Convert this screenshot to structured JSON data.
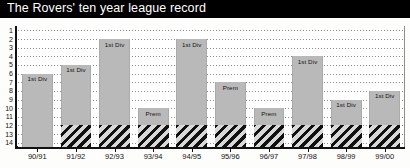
{
  "title": "The Rovers' ten year league record",
  "colors": {
    "title_bar": "#000000",
    "title_text": "#ffffff",
    "bar_fill": "#b9b9b9",
    "hatch_fill": "#d8d8d8",
    "hatch_line": "#111111",
    "gridline": "#8e8e8e",
    "axis": "#111111",
    "background": "#ffffff"
  },
  "axes": {
    "y_ticks": [
      "1",
      "2",
      "3",
      "4",
      "5",
      "6",
      "7",
      "8",
      "9",
      "10",
      "11",
      "12",
      "13",
      "14"
    ],
    "y_min": 1,
    "y_max": 14,
    "y_inverted": true,
    "x_ticks": [
      "90/91",
      "91/92",
      "92/93",
      "93/94",
      "94/95",
      "95/96",
      "96/97",
      "97/98",
      "98/99",
      "99/00"
    ]
  },
  "chart_data": {
    "type": "bar",
    "title": "The Rovers' ten year league record",
    "xlabel": "",
    "ylabel": "",
    "ylim": [
      1,
      14
    ],
    "y_inverted": true,
    "grid": true,
    "legend": "none",
    "categories": [
      "90/91",
      "91/92",
      "92/93",
      "93/94",
      "94/95",
      "95/96",
      "96/97",
      "97/98",
      "98/99",
      "99/00"
    ],
    "values": [
      6,
      5,
      2,
      10,
      2,
      7,
      10,
      4,
      9,
      8
    ],
    "annotations": [
      "1st Div",
      "1st Div",
      "1st Div",
      "Prem",
      "1st Div",
      "Prem",
      "Prem",
      "1st Div",
      "1st Div",
      "1st Div"
    ],
    "relegation_zone_start": 12,
    "series": [
      {
        "name": "Final league position",
        "values": [
          6,
          5,
          2,
          10,
          2,
          7,
          10,
          4,
          9,
          8
        ]
      }
    ],
    "bars": [
      {
        "season": "90/91",
        "position": 6,
        "division": "1st Div",
        "relegation_shaded": false
      },
      {
        "season": "91/92",
        "position": 5,
        "division": "1st Div",
        "relegation_shaded": true
      },
      {
        "season": "92/93",
        "position": 2,
        "division": "1st Div",
        "relegation_shaded": true
      },
      {
        "season": "93/94",
        "position": 10,
        "division": "Prem",
        "relegation_shaded": true
      },
      {
        "season": "94/95",
        "position": 2,
        "division": "1st Div",
        "relegation_shaded": true
      },
      {
        "season": "95/96",
        "position": 7,
        "division": "Prem",
        "relegation_shaded": true
      },
      {
        "season": "96/97",
        "position": 10,
        "division": "Prem",
        "relegation_shaded": true
      },
      {
        "season": "97/98",
        "position": 4,
        "division": "1st Div",
        "relegation_shaded": true
      },
      {
        "season": "98/99",
        "position": 9,
        "division": "1st Div",
        "relegation_shaded": true
      },
      {
        "season": "99/00",
        "position": 8,
        "division": "1st Div",
        "relegation_shaded": true
      }
    ]
  }
}
